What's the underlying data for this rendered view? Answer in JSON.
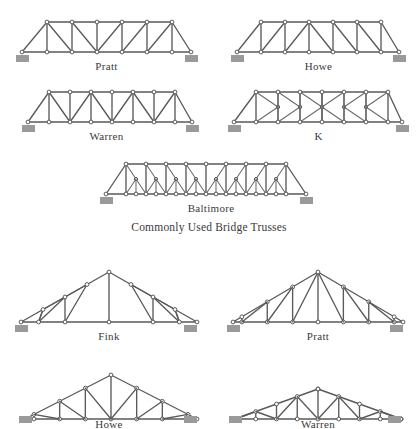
{
  "section_titles": {
    "bridge": "Commonly Used Bridge Trusses"
  },
  "figures": [
    {
      "id": "pratt-bridge",
      "caption": "Pratt",
      "group": "bridge",
      "x": 14,
      "y": 14,
      "w": 185,
      "h": 44,
      "caption_x": 14,
      "caption_y": 60,
      "caption_w": 185,
      "span": 185,
      "depth": 32,
      "geometry": {
        "type": "parallel-chord",
        "panels": 7,
        "diagonal_pattern": "toward-center",
        "end_post": "inclined",
        "verticals": true
      },
      "nodes_bottom": [
        [
          8,
          38
        ],
        [
          33,
          38
        ],
        [
          58,
          38
        ],
        [
          83,
          38
        ],
        [
          108,
          38
        ],
        [
          133,
          38
        ],
        [
          158,
          38
        ],
        [
          177,
          38
        ]
      ],
      "nodes_top": [
        [
          33,
          8
        ],
        [
          58,
          8
        ],
        [
          83,
          8
        ],
        [
          108,
          8
        ],
        [
          133,
          8
        ],
        [
          158,
          8
        ]
      ],
      "supports": [
        [
          8,
          38
        ],
        [
          177,
          38
        ]
      ]
    },
    {
      "id": "howe-bridge",
      "caption": "Howe",
      "group": "bridge",
      "x": 231,
      "y": 14,
      "w": 175,
      "h": 44,
      "caption_x": 231,
      "caption_y": 60,
      "caption_w": 175,
      "span": 175,
      "depth": 32,
      "geometry": {
        "type": "parallel-chord",
        "panels": 7,
        "diagonal_pattern": "away-from-center",
        "end_post": "inclined",
        "verticals": true
      },
      "nodes_bottom": [
        [
          6,
          38
        ],
        [
          30,
          38
        ],
        [
          54,
          38
        ],
        [
          78,
          38
        ],
        [
          102,
          38
        ],
        [
          126,
          38
        ],
        [
          150,
          38
        ],
        [
          168,
          38
        ]
      ],
      "nodes_top": [
        [
          30,
          8
        ],
        [
          54,
          8
        ],
        [
          78,
          8
        ],
        [
          102,
          8
        ],
        [
          126,
          8
        ],
        [
          150,
          8
        ]
      ],
      "supports": [
        [
          6,
          38
        ],
        [
          168,
          38
        ]
      ]
    },
    {
      "id": "warren-bridge",
      "caption": "Warren",
      "group": "bridge",
      "x": 22,
      "y": 84,
      "w": 178,
      "h": 44,
      "caption_x": 14,
      "caption_y": 130,
      "caption_w": 185,
      "span": 178,
      "depth": 32,
      "geometry": {
        "type": "parallel-chord",
        "panels": 8,
        "diagonal_pattern": "alternating-v",
        "end_post": "inclined",
        "verticals": true
      },
      "nodes_bottom": [
        [
          6,
          38
        ],
        [
          27,
          38
        ],
        [
          48,
          38
        ],
        [
          69,
          38
        ],
        [
          90,
          38
        ],
        [
          111,
          38
        ],
        [
          132,
          38
        ],
        [
          153,
          38
        ],
        [
          170,
          38
        ]
      ],
      "nodes_top": [
        [
          27,
          8
        ],
        [
          48,
          8
        ],
        [
          69,
          8
        ],
        [
          90,
          8
        ],
        [
          111,
          8
        ],
        [
          132,
          8
        ],
        [
          153,
          8
        ]
      ],
      "supports": [
        [
          6,
          38
        ],
        [
          170,
          38
        ]
      ]
    },
    {
      "id": "k-bridge",
      "caption": "K",
      "group": "bridge",
      "x": 228,
      "y": 84,
      "w": 180,
      "h": 44,
      "caption_x": 231,
      "caption_y": 130,
      "caption_w": 175,
      "span": 180,
      "depth": 32,
      "geometry": {
        "type": "parallel-chord",
        "panels": 8,
        "diagonal_pattern": "k-bracing",
        "end_post": "inclined",
        "verticals": true,
        "mid_height_nodes": true
      },
      "nodes_bottom": [
        [
          6,
          38
        ],
        [
          28,
          38
        ],
        [
          50,
          38
        ],
        [
          72,
          38
        ],
        [
          94,
          38
        ],
        [
          116,
          38
        ],
        [
          138,
          38
        ],
        [
          160,
          38
        ],
        [
          174,
          38
        ]
      ],
      "nodes_top": [
        [
          28,
          8
        ],
        [
          50,
          8
        ],
        [
          72,
          8
        ],
        [
          94,
          8
        ],
        [
          116,
          8
        ],
        [
          138,
          8
        ],
        [
          160,
          8
        ]
      ],
      "supports": [
        [
          6,
          38
        ],
        [
          174,
          38
        ]
      ]
    },
    {
      "id": "baltimore-bridge",
      "caption": "Baltimore",
      "group": "bridge",
      "x": 100,
      "y": 156,
      "w": 222,
      "h": 44,
      "caption_x": 100,
      "caption_y": 202,
      "caption_w": 222,
      "span": 222,
      "depth": 32,
      "geometry": {
        "type": "parallel-chord",
        "panels": 10,
        "diagonal_pattern": "subdivided-pratt",
        "end_post": "inclined",
        "verticals": true,
        "sub_struts": true
      },
      "nodes_bottom": [
        [
          6,
          38
        ],
        [
          26,
          38
        ],
        [
          46,
          38
        ],
        [
          66,
          38
        ],
        [
          86,
          38
        ],
        [
          106,
          38
        ],
        [
          126,
          38
        ],
        [
          146,
          38
        ],
        [
          166,
          38
        ],
        [
          186,
          38
        ],
        [
          206,
          38
        ]
      ],
      "nodes_top": [
        [
          26,
          8
        ],
        [
          46,
          8
        ],
        [
          66,
          8
        ],
        [
          86,
          8
        ],
        [
          106,
          8
        ],
        [
          126,
          8
        ],
        [
          146,
          8
        ],
        [
          166,
          8
        ],
        [
          186,
          8
        ]
      ],
      "supports": [
        [
          6,
          38
        ],
        [
          206,
          38
        ]
      ]
    },
    {
      "id": "fink-roof",
      "caption": "Fink",
      "group": "roof",
      "x": 14,
      "y": 266,
      "w": 190,
      "h": 62,
      "caption_x": 14,
      "caption_y": 330,
      "caption_w": 190,
      "span": 190,
      "rise": 50,
      "geometry": {
        "type": "pitched-roof",
        "web": "fink",
        "panels": 8,
        "king_post": true
      },
      "supports": [
        [
          7,
          56
        ],
        [
          176,
          56
        ]
      ]
    },
    {
      "id": "pratt-roof",
      "caption": "Pratt",
      "group": "roof",
      "x": 226,
      "y": 266,
      "w": 184,
      "h": 62,
      "caption_x": 226,
      "caption_y": 330,
      "caption_w": 184,
      "span": 184,
      "rise": 50,
      "geometry": {
        "type": "pitched-roof",
        "web": "pratt",
        "panels": 6,
        "king_post": true
      },
      "supports": [
        [
          7,
          56
        ],
        [
          170,
          56
        ]
      ]
    },
    {
      "id": "howe-roof",
      "caption": "Howe",
      "group": "roof",
      "x": 18,
      "y": 363,
      "w": 186,
      "h": 56,
      "caption_x": 14,
      "caption_y": 418,
      "caption_w": 190,
      "span": 186,
      "rise": 44,
      "geometry": {
        "type": "pitched-roof",
        "web": "howe",
        "panels": 6,
        "king_post": true
      },
      "supports": [
        [
          7,
          50
        ],
        [
          172,
          50
        ]
      ]
    },
    {
      "id": "warren-roof",
      "caption": "Warren",
      "group": "roof",
      "x": 228,
      "y": 363,
      "w": 180,
      "h": 56,
      "caption_x": 226,
      "caption_y": 418,
      "caption_w": 184,
      "span": 180,
      "rise": 30,
      "geometry": {
        "type": "cambered-roof",
        "web": "warren",
        "panels": 8,
        "verticals": true
      },
      "supports": [
        [
          7,
          50
        ],
        [
          166,
          50
        ]
      ]
    }
  ],
  "colors": {
    "member": "#5a5a5a",
    "node_fill": "#ffffff",
    "node_stroke": "#4a4a4a",
    "support": "#9a9a9a",
    "text": "#3a3a3a",
    "background": "#ffffff"
  }
}
